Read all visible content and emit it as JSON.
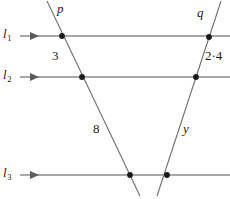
{
  "figure": {
    "type": "geometry-diagram",
    "width": 230,
    "height": 199,
    "background_color": "#ffffff",
    "stroke_color": "#6e6e6e",
    "parallel_line_color": "#8a8a8a",
    "point_color": "#1a1a1a",
    "text_color": "#1a1a1a"
  },
  "parallel_lines": [
    {
      "id": "l1",
      "label": "l",
      "subscript": "1",
      "y": 36,
      "x_start": 20,
      "x_end": 230,
      "arrow": "right"
    },
    {
      "id": "l2",
      "label": "l",
      "subscript": "2",
      "y": 77,
      "x_start": 20,
      "x_end": 230,
      "arrow": "right"
    },
    {
      "id": "l3",
      "label": "l",
      "subscript": "3",
      "y": 175,
      "x_start": 20,
      "x_end": 230,
      "arrow": "right"
    }
  ],
  "transversals": [
    {
      "id": "p",
      "label": "p",
      "x1": 47,
      "y1": 1,
      "x2": 140,
      "y2": 196,
      "direction": "down-right"
    },
    {
      "id": "q",
      "label": "q",
      "x1": 221,
      "y1": 1,
      "x2": 157,
      "y2": 196,
      "direction": "down-left"
    }
  ],
  "intersection_points": [
    {
      "id": "p-l1",
      "x": 62,
      "y": 36
    },
    {
      "id": "q-l1",
      "x": 209,
      "y": 37
    },
    {
      "id": "p-l2",
      "x": 82,
      "y": 77
    },
    {
      "id": "q-l2",
      "x": 196,
      "y": 77
    },
    {
      "id": "p-l3",
      "x": 130,
      "y": 175
    },
    {
      "id": "q-l3",
      "x": 167,
      "y": 175
    }
  ],
  "segment_labels": [
    {
      "id": "p-upper",
      "text": "3",
      "line": "p",
      "between": "l1-l2",
      "kind": "measure",
      "x": 52,
      "y": 49
    },
    {
      "id": "p-lower",
      "text": "8",
      "line": "p",
      "between": "l2-l3",
      "kind": "measure",
      "x": 93,
      "y": 122
    },
    {
      "id": "q-upper",
      "text": "2·4",
      "line": "q",
      "between": "l1-l2",
      "kind": "measure",
      "x": 205,
      "y": 49
    },
    {
      "id": "q-lower",
      "text": "y",
      "line": "q",
      "between": "l2-l3",
      "kind": "unknown",
      "x": 183,
      "y": 122
    }
  ],
  "line_name_labels": [
    {
      "id": "p-name",
      "text": "p",
      "x": 57,
      "y": 2
    },
    {
      "id": "q-name",
      "text": "q",
      "x": 197,
      "y": 6
    }
  ],
  "axis_labels": [
    {
      "id": "l1-name",
      "label": "l",
      "subscript": "1",
      "x": 3,
      "y": 27
    },
    {
      "id": "l2-name",
      "label": "l",
      "subscript": "2",
      "x": 3,
      "y": 68
    },
    {
      "id": "l3-name",
      "label": "l",
      "subscript": "3",
      "x": 3,
      "y": 166
    }
  ]
}
